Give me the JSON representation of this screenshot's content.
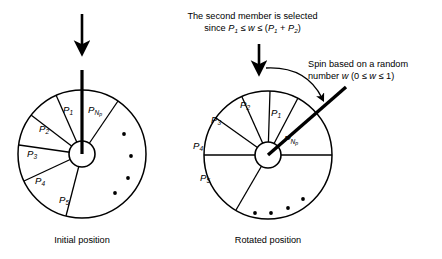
{
  "figure": {
    "background_color": "#ffffff",
    "stroke_color": "#000000"
  },
  "annotations": {
    "top_note": {
      "line1": "The second member is selected",
      "line2_prefix": "since ",
      "line2_p1": "P",
      "line2_p1_sub": "1",
      "line2_rel1": " ≤ ",
      "line2_w": "w",
      "line2_rel2": " ≤ (",
      "line2_p1b": "P",
      "line2_p1b_sub": "1",
      "line2_plus": " + ",
      "line2_p2": "P",
      "line2_p2_sub": "2",
      "line2_close": ")"
    },
    "right_note": {
      "line1": "Spin based on a random",
      "line2_prefix": "number ",
      "line2_w": "w",
      "line2_paren_open": " (0 ≤ ",
      "line2_w2": "w",
      "line2_rel": " ≤ 1)"
    }
  },
  "wheels": [
    {
      "id": "initial",
      "caption": "Initial position",
      "center": {
        "x": 82,
        "y": 154
      },
      "radius": 64,
      "hub_radius": 13,
      "pointer": {
        "name": "pointer-needle",
        "angle_deg": 90,
        "length": 84,
        "description": "vertical needle pointing up from hub"
      },
      "sectors": [
        {
          "label": "P",
          "sub": "1",
          "start_deg": 90,
          "end_deg": 114
        },
        {
          "label": "P",
          "sub": "2",
          "start_deg": 114,
          "end_deg": 143
        },
        {
          "label": "P",
          "sub": "3",
          "start_deg": 143,
          "end_deg": 172
        },
        {
          "label": "P",
          "sub": "4",
          "start_deg": 172,
          "end_deg": 205
        },
        {
          "label": "P",
          "sub": "5",
          "start_deg": 205,
          "end_deg": 256
        },
        {
          "label": "P",
          "sub": "N",
          "subsub": "p",
          "start_deg": 56,
          "end_deg": 90
        }
      ],
      "dots": [
        {
          "x": 124,
          "y": 134
        },
        {
          "x": 131,
          "y": 156
        },
        {
          "x": 128,
          "y": 178
        },
        {
          "x": 115,
          "y": 193
        }
      ]
    },
    {
      "id": "rotated",
      "caption": "Rotated position",
      "center": {
        "x": 268,
        "y": 155
      },
      "radius": 64,
      "hub_radius": 13,
      "pointer": {
        "name": "pointer-needle",
        "angle_deg": 41,
        "length": 104,
        "description": "thick needle pointing up-right toward random number label"
      },
      "sectors": [
        {
          "label": "P",
          "sub": "1",
          "start_deg": 62,
          "end_deg": 88
        },
        {
          "label": "P",
          "sub": "2",
          "start_deg": 88,
          "end_deg": 114
        },
        {
          "label": "P",
          "sub": "3",
          "start_deg": 114,
          "end_deg": 145
        },
        {
          "label": "P",
          "sub": "4",
          "start_deg": 145,
          "end_deg": 180
        },
        {
          "label": "P",
          "sub": "5",
          "start_deg": 180,
          "end_deg": 240
        },
        {
          "label": "P",
          "sub": "N",
          "subsub": "p",
          "start_deg": 0,
          "end_deg": 62
        }
      ],
      "dots": [
        {
          "x": 303,
          "y": 199
        },
        {
          "x": 288,
          "y": 208
        },
        {
          "x": 271,
          "y": 213
        },
        {
          "x": 255,
          "y": 213
        }
      ]
    }
  ],
  "arrows": {
    "initial_top_arrow": {
      "name": "down-arrow-initial",
      "x": 82,
      "y_from": 14,
      "y_to": 55
    },
    "rotated_top_arrow": {
      "name": "down-arrow-rotated",
      "x": 259,
      "y_from": 44,
      "y_to": 74
    },
    "spin_curved_arrow": {
      "name": "curved-spin-arrow",
      "description": "clockwise arc from above-left of rotated wheel to needle"
    }
  }
}
